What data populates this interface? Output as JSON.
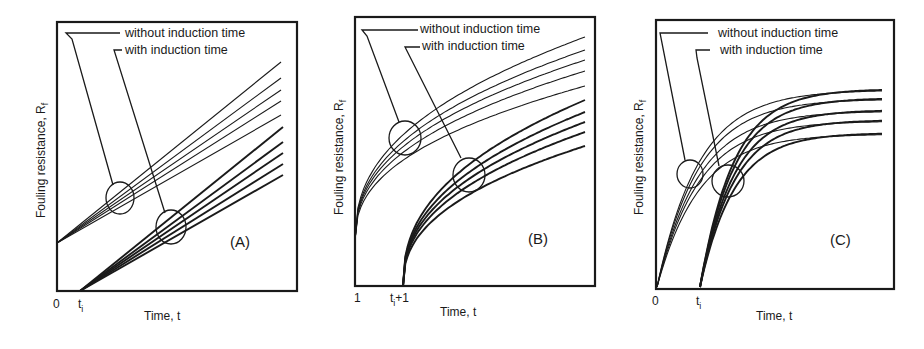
{
  "chart_data": [
    {
      "type": "line",
      "panel_label": "(A)",
      "model": "linear",
      "xlabel": "Time, t",
      "ylabel": "Fouling resistance, R_f",
      "ylabel_main": "Fouling resistance, R",
      "ylabel_sub": "f",
      "x_ticks": [
        {
          "label_main": "0",
          "label_sub": "",
          "label_suffix": ""
        },
        {
          "label_main": "t",
          "label_sub": "i",
          "label_suffix": ""
        }
      ],
      "legend": [
        {
          "label": "without induction time"
        },
        {
          "label": "with induction time"
        }
      ],
      "annotation_circles": 2,
      "series_groups": [
        {
          "name": "without induction time",
          "start_x": 0,
          "curves": 5
        },
        {
          "name": "with induction time",
          "start_x": "t_i",
          "curves": 5
        }
      ]
    },
    {
      "type": "line",
      "panel_label": "(B)",
      "model": "falling-rate",
      "xlabel": "Time, t",
      "ylabel": "Fouling resistance, R_f",
      "ylabel_main": "Fouling resistance, R",
      "ylabel_sub": "f",
      "x_ticks": [
        {
          "label_main": "1",
          "label_sub": "",
          "label_suffix": ""
        },
        {
          "label_main": "t",
          "label_sub": "i",
          "label_suffix": "+1"
        }
      ],
      "legend": [
        {
          "label": "without induction time"
        },
        {
          "label": "with induction time"
        }
      ],
      "annotation_circles": 2,
      "series_groups": [
        {
          "name": "without induction time",
          "start_x": 1,
          "curves": 5
        },
        {
          "name": "with induction time",
          "start_x": "t_i+1",
          "curves": 5
        }
      ]
    },
    {
      "type": "line",
      "panel_label": "(C)",
      "model": "asymptotic",
      "xlabel": "Time, t",
      "ylabel": "Fouling resistance, R_f",
      "ylabel_main": "Fouling resistance, R",
      "ylabel_sub": "f",
      "x_ticks": [
        {
          "label_main": "0",
          "label_sub": "",
          "label_suffix": ""
        },
        {
          "label_main": "t",
          "label_sub": "i",
          "label_suffix": ""
        }
      ],
      "legend": [
        {
          "label": "without induction time"
        },
        {
          "label": "with induction time"
        }
      ],
      "annotation_circles": 2,
      "series_groups": [
        {
          "name": "without induction time",
          "start_x": 0,
          "curves": 5
        },
        {
          "name": "with induction time",
          "start_x": "t_i",
          "curves": 5
        }
      ]
    }
  ]
}
